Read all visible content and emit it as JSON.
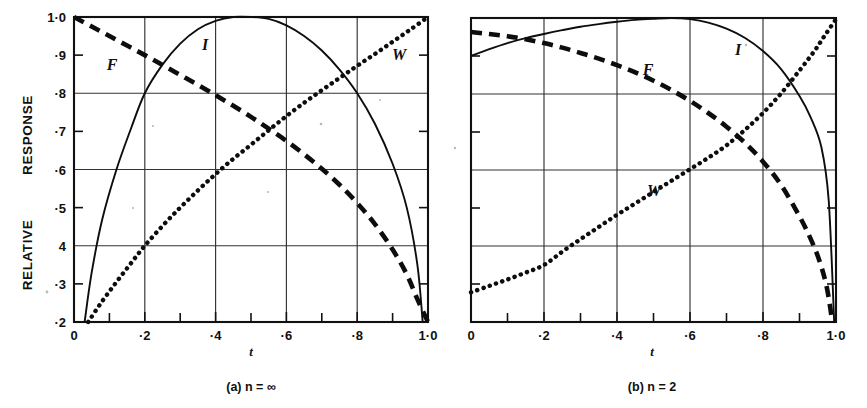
{
  "figure": {
    "background": "#ffffff",
    "ink_color": "#0d0d0d",
    "y_axis_title_top": "RESPONSE",
    "y_axis_title_bottom": "RELATIVE",
    "y_axis_title_full": "RELATIVE RESPONSE",
    "y_ticks": [
      "1·0",
      "·9",
      "·8",
      "·7",
      "·6",
      "·5",
      "4",
      "·3",
      "·2"
    ],
    "x_ticks": [
      "0",
      "·2",
      "·4",
      "·6",
      "·8",
      "1·0"
    ],
    "x_axis_var": "t"
  },
  "panels": [
    {
      "id": "panel-a",
      "caption_prefix": "(a)",
      "caption_var": "n",
      "caption_rel": "=",
      "caption_value": "∞",
      "caption_full": "(a) n = ∞",
      "labels": [
        {
          "name": "F",
          "x": 112,
          "y": 70
        },
        {
          "name": "I",
          "x": 205,
          "y": 50
        },
        {
          "name": "W",
          "x": 399,
          "y": 60
        }
      ]
    },
    {
      "id": "panel-b",
      "caption_prefix": "(b)",
      "caption_var": "n",
      "caption_rel": "=",
      "caption_value": "2",
      "caption_full": "(b) n = 2",
      "labels": [
        {
          "name": "F",
          "x": 648,
          "y": 75
        },
        {
          "name": "I",
          "x": 738,
          "y": 55
        },
        {
          "name": "W",
          "x": 654,
          "y": 196
        }
      ]
    }
  ],
  "chart_data": [
    {
      "type": "line",
      "title": "(a) n = ∞",
      "xlabel": "t",
      "ylabel": "RELATIVE RESPONSE",
      "xlim": [
        0,
        1
      ],
      "ylim": [
        0.2,
        1.0
      ],
      "xticks": [
        0,
        0.2,
        0.4,
        0.6,
        0.8,
        1.0
      ],
      "yticks": [
        0.2,
        0.3,
        0.4,
        0.5,
        0.6,
        0.7,
        0.8,
        0.9,
        1.0
      ],
      "gridlines_y": [
        0.4,
        0.6,
        0.8,
        1.0
      ],
      "gridlines_x": [
        0.2,
        0.4,
        0.6,
        0.8
      ],
      "grid": true,
      "legend": "inline-labels",
      "series": [
        {
          "name": "F",
          "style": "dashed",
          "x": [
            0.0,
            0.05,
            0.1,
            0.15,
            0.2,
            0.25,
            0.3,
            0.35,
            0.4,
            0.45,
            0.5,
            0.55,
            0.6,
            0.65,
            0.7,
            0.75,
            0.8,
            0.85,
            0.9,
            0.94,
            0.97,
            1.0
          ],
          "y": [
            1.0,
            0.975,
            0.95,
            0.925,
            0.9,
            0.874,
            0.848,
            0.822,
            0.795,
            0.767,
            0.738,
            0.707,
            0.675,
            0.64,
            0.602,
            0.56,
            0.512,
            0.457,
            0.39,
            0.325,
            0.26,
            0.2
          ]
        },
        {
          "name": "I",
          "style": "solid",
          "x": [
            0.03,
            0.05,
            0.08,
            0.12,
            0.16,
            0.2,
            0.25,
            0.3,
            0.35,
            0.4,
            0.45,
            0.5,
            0.55,
            0.6,
            0.65,
            0.7,
            0.75,
            0.8,
            0.85,
            0.9,
            0.94,
            0.97,
            0.985
          ],
          "y": [
            0.2,
            0.33,
            0.47,
            0.6,
            0.705,
            0.8,
            0.875,
            0.93,
            0.968,
            0.99,
            1.0,
            1.0,
            0.995,
            0.978,
            0.95,
            0.912,
            0.862,
            0.8,
            0.72,
            0.615,
            0.5,
            0.35,
            0.2
          ]
        },
        {
          "name": "W",
          "style": "dotted",
          "x": [
            0.04,
            0.08,
            0.12,
            0.16,
            0.2,
            0.25,
            0.3,
            0.35,
            0.4,
            0.45,
            0.5,
            0.55,
            0.6,
            0.65,
            0.7,
            0.75,
            0.8,
            0.85,
            0.9,
            0.95,
            1.0
          ],
          "y": [
            0.2,
            0.255,
            0.305,
            0.353,
            0.4,
            0.452,
            0.5,
            0.545,
            0.588,
            0.628,
            0.665,
            0.703,
            0.74,
            0.775,
            0.808,
            0.84,
            0.872,
            0.903,
            0.935,
            0.967,
            1.0
          ]
        }
      ]
    },
    {
      "type": "line",
      "title": "(b) n = 2",
      "xlabel": "t",
      "ylabel": "RELATIVE RESPONSE",
      "xlim": [
        0,
        1
      ],
      "ylim": [
        0.2,
        1.0
      ],
      "xticks": [
        0,
        0.2,
        0.4,
        0.6,
        0.8,
        1.0
      ],
      "yticks": [
        0.2,
        0.3,
        0.4,
        0.5,
        0.6,
        0.7,
        0.8,
        0.9,
        1.0
      ],
      "gridlines_y": [
        0.4,
        0.6,
        0.8,
        1.0
      ],
      "gridlines_x": [
        0.2,
        0.4,
        0.6,
        0.8
      ],
      "grid": true,
      "legend": "inline-labels",
      "series": [
        {
          "name": "F",
          "style": "dashed",
          "x": [
            0.0,
            0.05,
            0.1,
            0.15,
            0.2,
            0.25,
            0.3,
            0.35,
            0.4,
            0.45,
            0.5,
            0.55,
            0.6,
            0.65,
            0.7,
            0.75,
            0.8,
            0.85,
            0.9,
            0.93,
            0.955,
            0.975,
            0.99
          ],
          "y": [
            0.963,
            0.958,
            0.952,
            0.944,
            0.934,
            0.922,
            0.908,
            0.893,
            0.876,
            0.857,
            0.835,
            0.81,
            0.782,
            0.75,
            0.714,
            0.672,
            0.622,
            0.56,
            0.478,
            0.42,
            0.36,
            0.29,
            0.2
          ]
        },
        {
          "name": "I",
          "style": "solid",
          "x": [
            0.0,
            0.05,
            0.1,
            0.15,
            0.2,
            0.25,
            0.3,
            0.35,
            0.4,
            0.45,
            0.5,
            0.55,
            0.6,
            0.65,
            0.7,
            0.75,
            0.8,
            0.85,
            0.9,
            0.93,
            0.96,
            0.98,
            0.995
          ],
          "y": [
            0.9,
            0.918,
            0.934,
            0.947,
            0.958,
            0.968,
            0.977,
            0.984,
            0.99,
            0.995,
            0.998,
            1.0,
            0.997,
            0.988,
            0.972,
            0.948,
            0.913,
            0.865,
            0.795,
            0.74,
            0.66,
            0.52,
            0.2
          ]
        },
        {
          "name": "W",
          "style": "dotted",
          "x": [
            0.0,
            0.05,
            0.1,
            0.15,
            0.2,
            0.25,
            0.3,
            0.35,
            0.4,
            0.45,
            0.5,
            0.55,
            0.6,
            0.65,
            0.7,
            0.75,
            0.8,
            0.85,
            0.9,
            0.94,
            0.97,
            1.0
          ],
          "y": [
            0.278,
            0.295,
            0.312,
            0.33,
            0.35,
            0.385,
            0.418,
            0.45,
            0.482,
            0.512,
            0.542,
            0.572,
            0.602,
            0.632,
            0.665,
            0.705,
            0.75,
            0.802,
            0.862,
            0.912,
            0.955,
            0.997
          ]
        }
      ]
    }
  ]
}
